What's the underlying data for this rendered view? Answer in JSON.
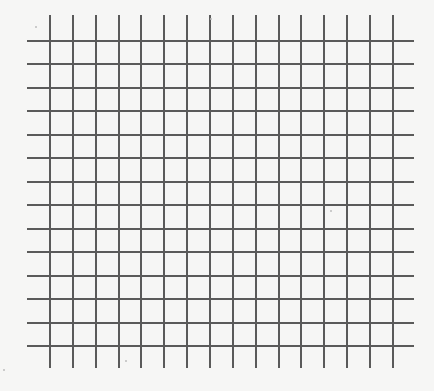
{
  "grid": {
    "line_color": "#5a5a5a",
    "line_width": 2,
    "background": "#f6f6f5",
    "vertical_lines": {
      "count": 16,
      "x_start": 50,
      "step": 22.85,
      "y_from": 15,
      "y_to": 368
    },
    "horizontal_lines": {
      "count": 14,
      "y_start": 41,
      "step": 23.46,
      "x_from": 27,
      "x_to": 414
    }
  },
  "specks": [
    {
      "x": 35,
      "y": 26
    },
    {
      "x": 3,
      "y": 369
    },
    {
      "x": 125,
      "y": 360
    },
    {
      "x": 210,
      "y": 18
    },
    {
      "x": 330,
      "y": 210
    }
  ]
}
